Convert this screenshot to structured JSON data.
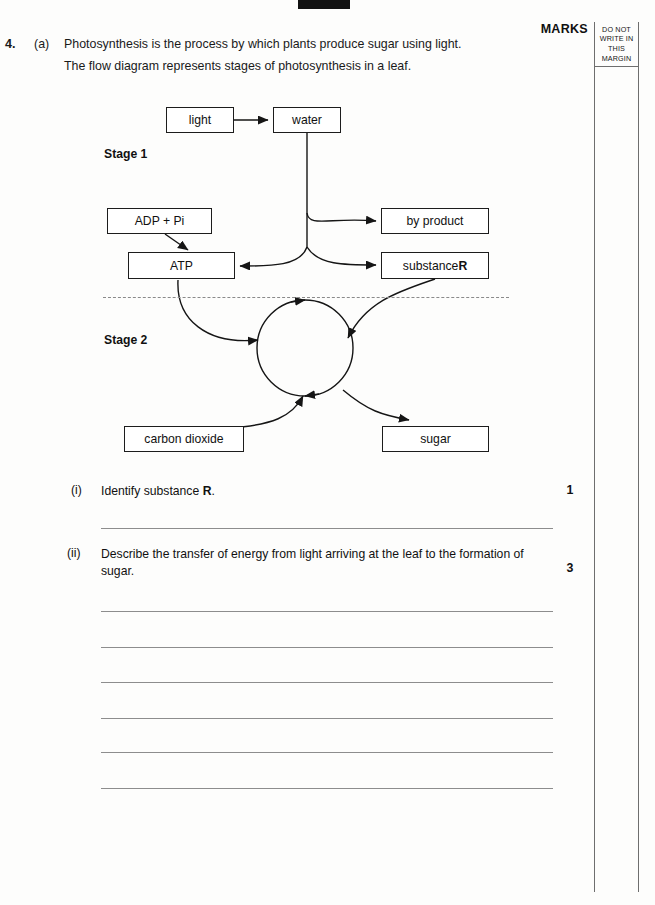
{
  "page": {
    "question_number": "4.",
    "part_letter": "(a)",
    "stem_line_1": "Photosynthesis is the process by which plants produce sugar using light.",
    "stem_line_2": "The flow diagram represents stages of photosynthesis in a leaf."
  },
  "margin": {
    "marks_heading": "MARKS",
    "notice_line_1": "DO NOT",
    "notice_line_2": "WRITE IN",
    "notice_line_3": "THIS",
    "notice_line_4": "MARGIN"
  },
  "diagram": {
    "stage_1_label": "Stage 1",
    "stage_2_label": "Stage 2",
    "boxes": {
      "light": "light",
      "water": "water",
      "adp_pi": "ADP + Pi",
      "atp": "ATP",
      "by_product": "by product",
      "substance_r_prefix": "substance ",
      "substance_r_letter": "R",
      "carbon_dioxide": "carbon dioxide",
      "sugar": "sugar"
    }
  },
  "questions": [
    {
      "label": "(i)",
      "text": "Identify substance R.",
      "text_prefix": "Identify substance ",
      "text_bold": "R",
      "text_suffix": ".",
      "marks": "1",
      "answer_lines": 1
    },
    {
      "label": "(ii)",
      "text_line_1": "Describe the transfer of energy from light arriving at the leaf to the",
      "text_line_2": "formation of sugar.",
      "marks": "3",
      "answer_lines": 6
    }
  ],
  "colors": {
    "page_background": "#fdfdfc",
    "ink": "#111111",
    "rule_line": "#8d8d8d",
    "margin_rule": "#6e6e6e",
    "registration_mark": "#121212"
  }
}
